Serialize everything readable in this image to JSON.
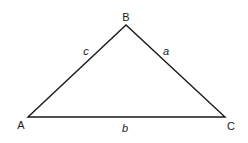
{
  "diagram": {
    "type": "triangle",
    "stroke_color": "#1a1a1a",
    "background": "#ffffff",
    "vertices": {
      "A": {
        "label": "A",
        "x": 28,
        "y": 117
      },
      "B": {
        "label": "B",
        "x": 126,
        "y": 25
      },
      "C": {
        "label": "C",
        "x": 225,
        "y": 117
      }
    },
    "sides": {
      "a": {
        "label": "a",
        "from": "B",
        "to": "C"
      },
      "b": {
        "label": "b",
        "from": "A",
        "to": "C"
      },
      "c": {
        "label": "c",
        "from": "A",
        "to": "B"
      }
    }
  }
}
